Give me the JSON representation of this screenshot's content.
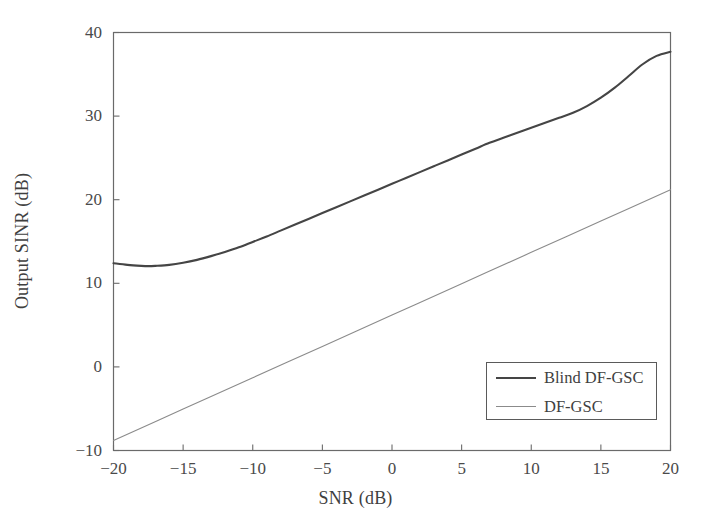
{
  "chart_data": {
    "type": "line",
    "title": "",
    "xlabel": "SNR (dB)",
    "ylabel": "Output SINR (dB)",
    "xlim": [
      -20,
      20
    ],
    "ylim": [
      -10,
      40
    ],
    "xticks": [
      -20,
      -15,
      -10,
      -5,
      0,
      5,
      10,
      15,
      20
    ],
    "xtick_labels": [
      "−20",
      "−15",
      "−10",
      "−5",
      "0",
      "5",
      "10",
      "15",
      "20"
    ],
    "yticks": [
      -10,
      0,
      10,
      20,
      30,
      40
    ],
    "ytick_labels": [
      "−10",
      "0",
      "10",
      "20",
      "30",
      "40"
    ],
    "grid": false,
    "legend_position": "lower right",
    "series": [
      {
        "name": "Blind DF-GSC",
        "color": "#454545",
        "line_width": 2.1,
        "x": [
          -20,
          -19,
          -18,
          -17.5,
          -17,
          -16,
          -15,
          -14,
          -13,
          -12,
          -11,
          -10,
          -9,
          -8,
          -7,
          -6,
          -5,
          -4,
          -3,
          -2,
          -1,
          0,
          1,
          2,
          3,
          4,
          5,
          6,
          7,
          8,
          9,
          10,
          11,
          12,
          13,
          14,
          15,
          16,
          17,
          18,
          19,
          20
        ],
        "y": [
          12.4,
          12.2,
          12.08,
          12.05,
          12.08,
          12.2,
          12.45,
          12.8,
          13.25,
          13.75,
          14.3,
          14.95,
          15.6,
          16.3,
          17.0,
          17.7,
          18.4,
          19.1,
          19.8,
          20.5,
          21.2,
          21.9,
          22.6,
          23.3,
          24.0,
          24.7,
          25.4,
          26.1,
          26.8,
          27.4,
          28.0,
          28.6,
          29.2,
          29.8,
          30.4,
          31.2,
          32.2,
          33.4,
          34.8,
          36.2,
          37.2,
          37.7
        ]
      },
      {
        "name": "DF-GSC",
        "color": "#8b8b8b",
        "line_width": 1.1,
        "x": [
          -20,
          -15,
          -10,
          -5,
          0,
          5,
          10,
          15,
          20
        ],
        "y": [
          -8.8,
          -5.05,
          -1.3,
          2.45,
          6.2,
          9.95,
          13.7,
          17.45,
          21.2
        ]
      }
    ]
  },
  "axes": {
    "frame_color": "#6a6a6a",
    "tick_color": "#6a6a6a"
  },
  "legend": {
    "entries": [
      {
        "label": "Blind DF-GSC"
      },
      {
        "label": "DF-GSC"
      }
    ]
  }
}
